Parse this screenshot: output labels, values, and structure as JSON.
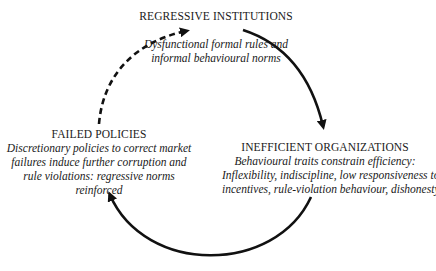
{
  "diagram": {
    "type": "cycle",
    "nodes": {
      "top": {
        "title": "REGRESSIVE INSTITUTIONS",
        "description_lines": [
          "Dysfunctional formal rules and",
          "informal behavioural norms"
        ]
      },
      "right": {
        "title": "INEFFICIENT ORGANIZATIONS",
        "description_lines": [
          "Behavioural traits constrain efficiency:",
          "Inflexibility, indiscipline, low responsiveness to",
          "incentives, rule-violation behaviour, dishonesty"
        ]
      },
      "left": {
        "title": "FAILED POLICIES",
        "description_lines": [
          "Discretionary policies to correct market",
          "failures induce further corruption and",
          "rule violations: regressive norms",
          "reinforced"
        ]
      }
    },
    "edges": [
      {
        "from": "REGRESSIVE INSTITUTIONS",
        "to": "INEFFICIENT ORGANIZATIONS",
        "style": "solid"
      },
      {
        "from": "INEFFICIENT ORGANIZATIONS",
        "to": "FAILED POLICIES",
        "style": "solid"
      },
      {
        "from": "FAILED POLICIES",
        "to": "REGRESSIVE INSTITUTIONS",
        "style": "dashed"
      }
    ],
    "colors": {
      "stroke": "#111111",
      "text": "#1a1a1a",
      "background": "#ffffff"
    }
  }
}
